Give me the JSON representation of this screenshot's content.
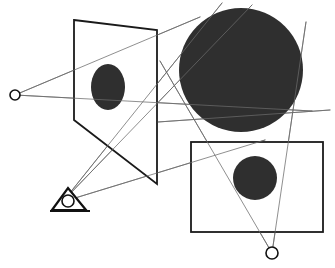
{
  "figure": {
    "width": 335,
    "height": 268,
    "background_color": "#ffffff"
  },
  "style": {
    "fill_dark": "#2f2f2f",
    "shape_outline_color": "#1a1a1a",
    "ray_color": "#6b6b6b",
    "point_color": "#111111",
    "shape_stroke_width": 1.8,
    "ray_stroke_width": 0.8,
    "point_stroke_width": 1.6
  },
  "shapes": {
    "image_plane": {
      "label": "image-plane-parallelogram",
      "points": "74,20 157,30 157,184 74,120",
      "fill": "#ffffff",
      "stroke": "#1a1a1a",
      "stroke_width": 1.8
    },
    "plane_blob": {
      "label": "projected-ellipse",
      "cx": 108,
      "cy": 87,
      "rx": 17,
      "ry": 23,
      "fill": "#2f2f2f"
    },
    "big_disk": {
      "label": "object-sphere-large",
      "cx": 241,
      "cy": 70,
      "r": 62,
      "fill": "#2f2f2f"
    },
    "ground_rect": {
      "label": "ground-rectangle",
      "x": 191,
      "y": 142,
      "width": 132,
      "height": 90,
      "fill": "#ffffff",
      "stroke": "#1a1a1a",
      "stroke_width": 1.8
    },
    "rect_blob": {
      "label": "shadow-disk-small",
      "cx": 255,
      "cy": 178,
      "r": 22,
      "fill": "#2f2f2f"
    }
  },
  "points": [
    {
      "name": "light-source-point-left",
      "cx": 15,
      "cy": 95,
      "r": 5,
      "fill": "#ffffff",
      "stroke": "#111111"
    },
    {
      "name": "vanishing-point-bottom-right",
      "cx": 272,
      "cy": 253,
      "r": 6,
      "fill": "#ffffff",
      "stroke": "#111111"
    }
  ],
  "viewer_icon": {
    "name": "eye-viewpoint-icon",
    "triangle": "52,210 86,210 68,188",
    "pupil": {
      "cx": 68,
      "cy": 201,
      "r": 6
    },
    "base_line": {
      "x1": 50,
      "y1": 211,
      "x2": 90,
      "y2": 211
    },
    "stroke": "#111111"
  },
  "rays": [
    {
      "name": "ray-left-source-to-plane-top",
      "x1": 15,
      "y1": 95,
      "x2": 200,
      "y2": 17
    },
    {
      "name": "ray-left-source-to-plane-mid",
      "x1": 15,
      "y1": 95,
      "x2": 312,
      "y2": 111
    },
    {
      "name": "ray-viewer-to-upper-right",
      "x1": 65,
      "y1": 199,
      "x2": 222,
      "y2": 3
    },
    {
      "name": "ray-viewer-to-sphere-edge",
      "x1": 65,
      "y1": 199,
      "x2": 252,
      "y2": 5
    },
    {
      "name": "ray-viewer-to-far-right",
      "x1": 62,
      "y1": 202,
      "x2": 265,
      "y2": 140
    },
    {
      "name": "ray-vp-to-upper-left-plane",
      "x1": 272,
      "y1": 253,
      "x2": 160,
      "y2": 61
    },
    {
      "name": "ray-vp-to-sphere-top-right",
      "x1": 272,
      "y1": 253,
      "x2": 306,
      "y2": 22
    },
    {
      "name": "ray-horizon-through-sphere",
      "x1": 158,
      "y1": 122,
      "x2": 330,
      "y2": 110
    }
  ],
  "semantics": {
    "description": "Perspective projection construction: a light/eye point on the left, an image plane parallelogram with a projected ellipse, a large filled sphere, a ground rectangle with a smaller filled disk, an eye viewpoint marker, and thin construction rays converging at two marked points."
  }
}
